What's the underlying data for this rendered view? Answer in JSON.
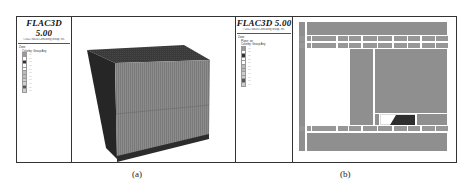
{
  "figure": {
    "panels": [
      {
        "id": "a",
        "caption": "(a)",
        "legend": {
          "app_title": "FLAC3D 5.00",
          "subtitle": "©2012 Itasca Consulting Group, Inc.",
          "section": "Zone",
          "subsection": "Colorby: Group    Any",
          "entries": [
            {
              "label": "…",
              "color": "#9a9a9a"
            },
            {
              "label": "…",
              "color": "#ffffff"
            },
            {
              "label": "…",
              "color": "#333333"
            },
            {
              "label": "…",
              "color": "#ffffff"
            },
            {
              "label": "…",
              "color": "#ffffff"
            },
            {
              "label": "…",
              "color": "#bbbbbb"
            },
            {
              "label": "…",
              "color": "#bbbbbb"
            },
            {
              "label": "…",
              "color": "#cfcfcf"
            },
            {
              "label": "…",
              "color": "#cfcfcf"
            },
            {
              "label": "…",
              "color": "#555555"
            },
            {
              "label": "…",
              "color": "#cccccc"
            }
          ]
        },
        "view": {
          "type": "3d-block-model",
          "top_face_color": "#3e3e3e",
          "side_face_color": "#2a2a2a",
          "front_face_color": "#8a8a8a",
          "base_layer_color": "#303030"
        }
      },
      {
        "id": "b",
        "caption": "(b)",
        "legend": {
          "app_title": "FLAC3D 5.00",
          "subtitle": "©2012 Itasca Consulting Group, Inc.",
          "section": "Zone",
          "subsection_1": "Plane: on",
          "subsection": "Colorby: Group    Any",
          "entries": [
            {
              "label": "…",
              "color": "#9a9a9a"
            },
            {
              "label": "…",
              "color": "#ffffff"
            },
            {
              "label": "…",
              "color": "#333333"
            },
            {
              "label": "…",
              "color": "#ffffff"
            },
            {
              "label": "…",
              "color": "#ffffff"
            },
            {
              "label": "…",
              "color": "#bbbbbb"
            },
            {
              "label": "…",
              "color": "#bbbbbb"
            },
            {
              "label": "…",
              "color": "#cfcfcf"
            },
            {
              "label": "…",
              "color": "#cfcfcf"
            },
            {
              "label": "…",
              "color": "#555555"
            },
            {
              "label": "…",
              "color": "#cccccc"
            }
          ]
        },
        "view": {
          "type": "2d-section",
          "rock_color": "#8f8f8f",
          "void_color": "#ffffff",
          "support_color": "#2e2e2e"
        }
      }
    ]
  }
}
